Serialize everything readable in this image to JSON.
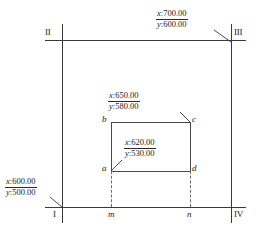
{
  "figure": {
    "type": "coordinate-boundary-diagram",
    "corners": [
      {
        "name": "corner-marker-i",
        "label": "I",
        "x": 62,
        "y": 207
      },
      {
        "name": "corner-marker-ii",
        "label": "II",
        "x": 62,
        "y": 40
      },
      {
        "name": "corner-marker-iii",
        "label": "III",
        "x": 231,
        "y": 40
      },
      {
        "name": "corner-marker-iv",
        "label": "IV",
        "x": 231,
        "y": 207
      }
    ],
    "vertices": [
      {
        "name": "vertex-a",
        "label": "a",
        "x": 111,
        "y": 171
      },
      {
        "name": "vertex-b",
        "label": "b",
        "x": 111,
        "y": 122
      },
      {
        "name": "vertex-c",
        "label": "c",
        "x": 190,
        "y": 122
      },
      {
        "name": "vertex-d",
        "label": "d",
        "x": 190,
        "y": 171
      }
    ],
    "ticks": [
      {
        "name": "tick-m",
        "label": "m",
        "x": 111
      },
      {
        "name": "tick-n",
        "label": "n",
        "x": 190
      }
    ],
    "callouts": [
      {
        "name": "callout-origin",
        "x_label": "x",
        "x_value": "600.00",
        "y_label": "y",
        "y_value": "500.00",
        "separator": ":",
        "target": "corner-i"
      },
      {
        "name": "callout-extent",
        "x_label": "x",
        "x_value": "700.00",
        "y_label": "y",
        "y_value": "600.00",
        "separator": ":",
        "target": "corner-iii"
      },
      {
        "name": "callout-inner-upper",
        "x_label": "x",
        "x_value": "650.00",
        "y_label": "y",
        "y_value": "580.00",
        "separator": ":",
        "target": "vertex-c"
      },
      {
        "name": "callout-inner-lower",
        "x_label": "x",
        "x_value": "620.00",
        "y_label": "y",
        "y_value": "530.00",
        "separator": ":",
        "target": "vertex-a"
      }
    ]
  },
  "colors": {
    "line": "#3a3a3a",
    "text": "#1a1a1a",
    "dashed": "#6a6a6a",
    "background": "#ffffff"
  }
}
